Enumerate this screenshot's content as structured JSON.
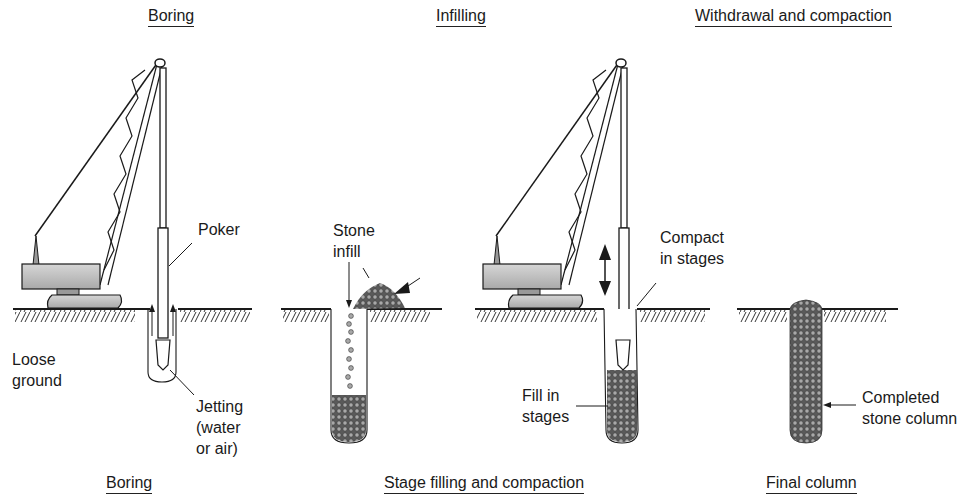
{
  "headings": {
    "top": [
      "Boring",
      "Infilling",
      "Withdrawal and compaction"
    ],
    "bottom": [
      "Boring",
      "Stage filling and compaction",
      "Final column"
    ]
  },
  "labels": {
    "poker": "Poker",
    "loose_ground": [
      "Loose",
      "ground"
    ],
    "jetting": [
      "Jetting",
      "(water",
      "or air)"
    ],
    "stone_infill": [
      "Stone",
      "infill"
    ],
    "compact": [
      "Compact",
      "in stages"
    ],
    "fill": [
      "Fill in",
      "stages"
    ],
    "completed": [
      "Completed",
      "stone column"
    ]
  },
  "colors": {
    "line": "#1a1a1a",
    "machine_fill": "#bdbdbd",
    "stone_fill": "#6a6a6a"
  }
}
